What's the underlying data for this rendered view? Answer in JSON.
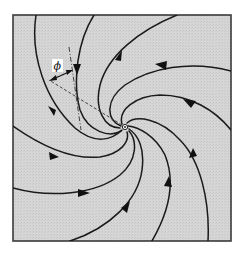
{
  "diagram": {
    "title": "",
    "type": "spiral-flow-field",
    "angle_label": "ϕ",
    "colors": {
      "background": "#d4d4d4",
      "frame": "#3a3a3a",
      "streamline": "#1a1a1a",
      "page": "#ffffff"
    },
    "center": {
      "x": 125,
      "y": 127
    },
    "frame": {
      "x": 13,
      "y": 15,
      "width": 218,
      "height": 226
    },
    "streamline_count": 8,
    "flow_direction": "inward spiral toward center",
    "annotations": [
      {
        "kind": "dashed-radial-line",
        "description": "radius from center to a point on a streamline"
      },
      {
        "kind": "dash-dot-tangent-line",
        "description": "tangent to the streamline at that point"
      },
      {
        "kind": "angle-label",
        "text": "ϕ",
        "description": "angle between radial line and streamline tangent"
      }
    ]
  }
}
